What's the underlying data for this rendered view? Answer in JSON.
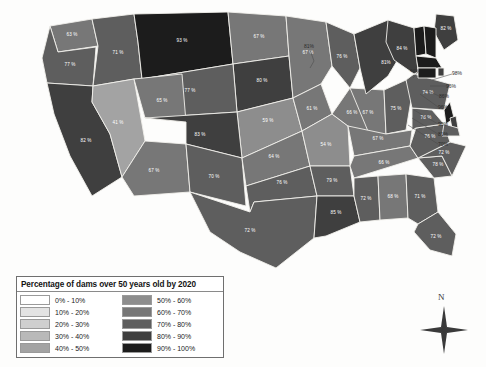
{
  "legend": {
    "title": "Percentage of dams over 50 years old by 2020",
    "left_column": [
      {
        "label": "0% - 10%",
        "color": "#ffffff"
      },
      {
        "label": "10% - 20%",
        "color": "#e3e3e3"
      },
      {
        "label": "20% - 30%",
        "color": "#cfcfcf"
      },
      {
        "label": "30% - 40%",
        "color": "#b9b9b9"
      },
      {
        "label": "40% - 50%",
        "color": "#a3a3a3"
      }
    ],
    "right_column": [
      {
        "label": "50% - 60%",
        "color": "#8d8d8d"
      },
      {
        "label": "60% - 70%",
        "color": "#777777"
      },
      {
        "label": "70% - 80%",
        "color": "#5e5e5e"
      },
      {
        "label": "80% - 90%",
        "color": "#3f3f3f"
      },
      {
        "label": "90% - 100%",
        "color": "#1c1c1c"
      }
    ]
  },
  "compass": {
    "north_label": "N"
  },
  "page_bleed": {
    "left": "",
    "right": "",
    "bottom": "",
    "bottom2": "",
    "caption": ""
  },
  "chart_data": {
    "type": "choropleth",
    "title": "Percentage of dams over 50 years old by 2020",
    "unit": "%",
    "value_range": [
      41,
      98
    ],
    "bins": [
      {
        "range": [
          0,
          10
        ],
        "label": "0% - 10%",
        "color": "#ffffff"
      },
      {
        "range": [
          10,
          20
        ],
        "label": "10% - 20%",
        "color": "#e3e3e3"
      },
      {
        "range": [
          20,
          30
        ],
        "label": "20% - 30%",
        "color": "#cfcfcf"
      },
      {
        "range": [
          30,
          40
        ],
        "label": "30% - 40%",
        "color": "#b9b9b9"
      },
      {
        "range": [
          40,
          50
        ],
        "label": "40% - 50%",
        "color": "#a3a3a3"
      },
      {
        "range": [
          50,
          60
        ],
        "label": "50% - 60%",
        "color": "#8d8d8d"
      },
      {
        "range": [
          60,
          70
        ],
        "label": "60% - 70%",
        "color": "#777777"
      },
      {
        "range": [
          70,
          80
        ],
        "label": "70% - 80%",
        "color": "#5e5e5e"
      },
      {
        "range": [
          80,
          90
        ],
        "label": "80% - 90%",
        "color": "#3f3f3f"
      },
      {
        "range": [
          90,
          100
        ],
        "label": "90% - 100%",
        "color": "#1c1c1c"
      }
    ],
    "regions": [
      {
        "code": "WA",
        "name": "Washington",
        "value": 63,
        "label": "63 %"
      },
      {
        "code": "OR",
        "name": "Oregon",
        "value": 77,
        "label": "77 %"
      },
      {
        "code": "ID",
        "name": "Idaho",
        "value": 71,
        "label": "71 %"
      },
      {
        "code": "MT",
        "name": "Montana",
        "value": 93,
        "label": "93 %"
      },
      {
        "code": "ND",
        "name": "North Dakota",
        "value": 67,
        "label": "67 %"
      },
      {
        "code": "SD",
        "name": "South Dakota",
        "value": 80,
        "label": "80 %"
      },
      {
        "code": "WY",
        "name": "Wyoming",
        "value": 77,
        "label": "77 %"
      },
      {
        "code": "NE",
        "name": "Nebraska",
        "value": 59,
        "label": "59 %"
      },
      {
        "code": "MN",
        "name": "Minnesota",
        "value": 67,
        "label": "67 %"
      },
      {
        "code": "IA",
        "name": "Iowa",
        "value": 61,
        "label": "61 %"
      },
      {
        "code": "CA",
        "name": "California",
        "value": 82,
        "label": "82 %"
      },
      {
        "code": "NV",
        "name": "Nevada",
        "value": 41,
        "label": "41 %"
      },
      {
        "code": "UT",
        "name": "Utah",
        "value": 65,
        "label": "65 %"
      },
      {
        "code": "CO",
        "name": "Colorado",
        "value": 83,
        "label": "83 %"
      },
      {
        "code": "AZ",
        "name": "Arizona",
        "value": 67,
        "label": "67 %"
      },
      {
        "code": "NM",
        "name": "New Mexico",
        "value": 70,
        "label": "70 %"
      },
      {
        "code": "KS",
        "name": "Kansas",
        "value": 64,
        "label": "64 %"
      },
      {
        "code": "MO",
        "name": "Missouri",
        "value": 54,
        "label": "54 %"
      },
      {
        "code": "OK",
        "name": "Oklahoma",
        "value": 76,
        "label": "76 %"
      },
      {
        "code": "TX",
        "name": "Texas",
        "value": 72,
        "label": "72 %"
      },
      {
        "code": "AR",
        "name": "Arkansas",
        "value": 79,
        "label": "79 %"
      },
      {
        "code": "LA",
        "name": "Louisiana",
        "value": 85,
        "label": "85 %"
      },
      {
        "code": "WI",
        "name": "Wisconsin",
        "value": 76,
        "label": "76 %"
      },
      {
        "code": "IL",
        "name": "Illinois",
        "value": 66,
        "label": "66 %"
      },
      {
        "code": "IN",
        "name": "Indiana",
        "value": 67,
        "label": "67 %"
      },
      {
        "code": "OH",
        "name": "Ohio",
        "value": 75,
        "label": "75 %"
      },
      {
        "code": "MI",
        "name": "Michigan",
        "value": 81,
        "label": "81%"
      },
      {
        "code": "KY",
        "name": "Kentucky",
        "value": 67,
        "label": "67 %"
      },
      {
        "code": "TN",
        "name": "Tennessee",
        "value": 66,
        "label": "66 %"
      },
      {
        "code": "MS",
        "name": "Mississippi",
        "value": 72,
        "label": "72 %"
      },
      {
        "code": "AL",
        "name": "Alabama",
        "value": 68,
        "label": "68 %"
      },
      {
        "code": "GA",
        "name": "Georgia",
        "value": 71,
        "label": "71 %"
      },
      {
        "code": "FL",
        "name": "Florida",
        "value": 72,
        "label": "72 %"
      },
      {
        "code": "SC",
        "name": "South Carolina",
        "value": 78,
        "label": "78 %"
      },
      {
        "code": "NC",
        "name": "North Carolina",
        "value": 72,
        "label": "72 %"
      },
      {
        "code": "VA",
        "name": "Virginia",
        "value": 76,
        "label": "76 %"
      },
      {
        "code": "WV",
        "name": "West Virginia",
        "value": 78,
        "label": "78 %"
      },
      {
        "code": "PA",
        "name": "Pennsylvania",
        "value": 74,
        "label": "74 %"
      },
      {
        "code": "NY",
        "name": "New York",
        "value": 84,
        "label": "84 %"
      },
      {
        "code": "ME",
        "name": "Maine",
        "value": 82,
        "label": "82 %"
      },
      {
        "code": "VT",
        "name": "Vermont",
        "value": 94,
        "label": "94%"
      },
      {
        "code": "NH",
        "name": "New Hampshire",
        "value": 98,
        "label": "98%"
      },
      {
        "code": "MA",
        "name": "Massachusetts",
        "value": 96,
        "label": "96%"
      },
      {
        "code": "RI",
        "name": "Rhode Island",
        "value": 86,
        "label": "86%"
      },
      {
        "code": "CT",
        "name": "Connecticut",
        "value": 96,
        "label": "96%"
      },
      {
        "code": "NJ",
        "name": "New Jersey",
        "value": 90,
        "label": "90%"
      },
      {
        "code": "DE",
        "name": "Delaware",
        "value": 81,
        "label": "81%"
      },
      {
        "code": "MD",
        "name": "Maryland",
        "value": 70,
        "label": "70%"
      }
    ],
    "callouts": [
      {
        "code": "MI",
        "label": "81%"
      },
      {
        "code": "VT",
        "label": "94%"
      },
      {
        "code": "NH",
        "label": "98%"
      },
      {
        "code": "MA",
        "label": "96%"
      },
      {
        "code": "RI",
        "label": "86%"
      },
      {
        "code": "CT",
        "label": "96%"
      },
      {
        "code": "NJ",
        "label": "90%"
      },
      {
        "code": "DE",
        "label": "81%"
      },
      {
        "code": "MD",
        "label": "70%"
      }
    ]
  }
}
